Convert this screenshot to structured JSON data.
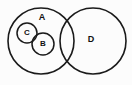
{
  "figure": {
    "type": "euler-diagram",
    "background_color": "#fcfcfc",
    "stroke_color": "#1a1a1a",
    "label_color": "#111111",
    "width": 132,
    "height": 85
  },
  "sets": [
    {
      "id": "A",
      "label": "A",
      "shape": "circle",
      "cx": 41,
      "cy": 41,
      "r": 33,
      "stroke_width": 1.6,
      "label_x": 42,
      "label_y": 18,
      "label_size": 9
    },
    {
      "id": "C",
      "label": "C",
      "shape": "circle",
      "cx": 27,
      "cy": 33,
      "r": 10,
      "stroke_width": 1.5,
      "label_x": 27,
      "label_y": 33,
      "label_size": 8
    },
    {
      "id": "B",
      "label": "B",
      "shape": "circle",
      "cx": 43,
      "cy": 44,
      "r": 11,
      "stroke_width": 1.5,
      "label_x": 43,
      "label_y": 44,
      "label_size": 8
    },
    {
      "id": "D",
      "label": "D",
      "shape": "circle",
      "cx": 93,
      "cy": 41,
      "r": 33,
      "stroke_width": 1.6,
      "label_x": 91,
      "label_y": 40,
      "label_size": 9
    }
  ],
  "chart_data": {
    "type": "diagram",
    "title": "",
    "subtype": "euler-venn",
    "legend": [],
    "regions": [
      {
        "name": "A only",
        "members": [
          "A"
        ]
      },
      {
        "name": "C inside A",
        "members": [
          "A",
          "C"
        ]
      },
      {
        "name": "B inside A",
        "members": [
          "A",
          "B"
        ]
      },
      {
        "name": "B and C overlap inside A",
        "members": [
          "A",
          "B",
          "C"
        ]
      },
      {
        "name": "A and D overlap",
        "members": [
          "A",
          "D"
        ]
      },
      {
        "name": "D only",
        "members": [
          "D"
        ]
      }
    ],
    "labels": [
      "A",
      "C",
      "B",
      "D"
    ]
  }
}
